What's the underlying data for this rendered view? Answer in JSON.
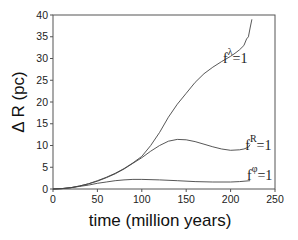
{
  "chart_data": {
    "type": "line",
    "title": "",
    "xlabel": "time (million years)",
    "ylabel": "Δ R (pc)",
    "xlim": [
      0,
      250
    ],
    "ylim": [
      0,
      40
    ],
    "xticks": [
      0,
      50,
      100,
      150,
      200,
      250
    ],
    "yticks": [
      0,
      5,
      10,
      15,
      20,
      25,
      30,
      35,
      40
    ],
    "grid": false,
    "legend": "inline labels near curve ends",
    "series": [
      {
        "name": "f^λ=1",
        "label_base": "f",
        "label_sup": "λ",
        "label_tail": "=1",
        "x": [
          0,
          10,
          20,
          30,
          40,
          50,
          60,
          70,
          80,
          90,
          100,
          110,
          120,
          130,
          140,
          150,
          160,
          170,
          180,
          190,
          200,
          205,
          210,
          215,
          218,
          220,
          222,
          224
        ],
        "y": [
          0,
          0.1,
          0.3,
          0.7,
          1.2,
          1.9,
          2.7,
          3.6,
          4.7,
          6.0,
          7.5,
          10.0,
          13.0,
          16.5,
          19.5,
          22.0,
          24.5,
          26.5,
          28.0,
          29.3,
          30.5,
          31.2,
          32.0,
          33.0,
          34.5,
          35.0,
          37.0,
          39.0
        ]
      },
      {
        "name": "f^R=1",
        "label_base": "f",
        "label_sup": "R",
        "label_tail": "=1",
        "x": [
          0,
          10,
          20,
          30,
          40,
          50,
          60,
          70,
          80,
          90,
          100,
          110,
          120,
          130,
          140,
          150,
          160,
          170,
          180,
          190,
          200,
          210,
          215,
          220,
          222
        ],
        "y": [
          0,
          0.1,
          0.3,
          0.7,
          1.2,
          1.8,
          2.6,
          3.5,
          4.6,
          5.9,
          7.2,
          8.7,
          10.0,
          11.0,
          11.4,
          11.3,
          10.9,
          10.3,
          9.7,
          9.2,
          8.9,
          9.0,
          9.2,
          9.6,
          10.2
        ]
      },
      {
        "name": "f^φ=1",
        "label_base": "f",
        "label_sup": "φ",
        "label_tail": "=1",
        "x": [
          0,
          10,
          20,
          30,
          40,
          50,
          60,
          70,
          80,
          90,
          100,
          120,
          140,
          160,
          180,
          200,
          210,
          222
        ],
        "y": [
          0,
          0.1,
          0.3,
          0.6,
          0.9,
          1.3,
          1.6,
          1.9,
          2.1,
          2.2,
          2.2,
          2.1,
          1.9,
          1.7,
          1.6,
          1.6,
          1.7,
          1.9
        ]
      }
    ]
  }
}
